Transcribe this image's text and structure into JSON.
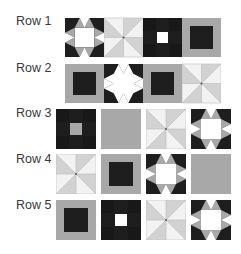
{
  "colors": {
    "dark": "#1e1e1e",
    "mid": "#a8a8a8",
    "light": "#d2d2d2",
    "white": "#ffffff",
    "pale": "#f2f2f2"
  },
  "rows": [
    {
      "label": "Row 1",
      "tiles": [
        "star-gray",
        "pinwheel",
        "nine-patch-white",
        "square-dark-on-gray"
      ]
    },
    {
      "label": "Row 2",
      "tiles": [
        "square-dark-on-gray",
        "star-white",
        "square-dark-on-gray",
        "pinwheel"
      ]
    },
    {
      "label": "Row 3",
      "tiles": [
        "nine-patch-gray",
        "solid-gray",
        "pinwheel",
        "star-gray"
      ]
    },
    {
      "label": "Row 4",
      "tiles": [
        "pinwheel",
        "square-dark-on-gray",
        "star-gray",
        "solid-gray"
      ]
    },
    {
      "label": "Row 5",
      "tiles": [
        "square-dark-on-gray",
        "nine-patch-white",
        "pinwheel",
        "star-gray"
      ]
    }
  ]
}
